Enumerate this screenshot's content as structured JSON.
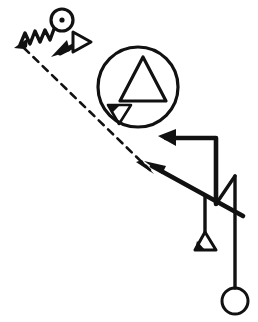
{
  "canvas": {
    "width": 258,
    "height": 322,
    "background_color": "#ffffff",
    "ink_color": "#111111",
    "title": "Abstract line-and-symbol sketch diagram"
  },
  "shapes": {
    "dot_circle": {
      "name": "circle-with-center-dot",
      "cx": 62,
      "cy": 20,
      "r": 11,
      "stroke_width": 3.2,
      "dot_r": 2.6,
      "label": "ringed dot marker"
    },
    "zigzag": {
      "name": "zigzag-spring-line",
      "points": "20,45 25,33 30,44 35,31 40,42 45,30 50,40 54,29",
      "stroke_width": 3.4,
      "label": "spring / zigzag connector"
    },
    "zigzag_arrowhead": {
      "name": "zigzag-arrowhead",
      "points": "14,48 28,38 27,47 24,49",
      "label": "filled arrowhead at zigzag tail"
    },
    "double_arrow": {
      "name": "double-headed-arrow",
      "shaft": {
        "x1": 62,
        "y1": 52,
        "x2": 78,
        "y2": 43
      },
      "stroke_width": 5,
      "solid_head": {
        "name": "solid-arrowhead-lower-left",
        "points": "52,56 70,50 66,41"
      },
      "hollow_head": {
        "name": "hollow-arrowhead-upper-right",
        "points": "72,51 72,33 90,42"
      },
      "label": "bidirectional arrow, one solid one outlined head"
    },
    "big_circle": {
      "name": "large-enclosing-circle",
      "cx": 138,
      "cy": 87,
      "r": 40,
      "stroke_width": 3.2,
      "label": "large ring containing two triangles"
    },
    "big_triangle": {
      "name": "large-up-triangle",
      "points": "143,57 166,101 120,101",
      "stroke_width": 3.2,
      "label": "hollow upward triangle inside ring"
    },
    "small_triangle": {
      "name": "small-down-triangle",
      "points": "108,105 131,105 119,124",
      "stroke_width": 2.6,
      "label": "small downward triangle inside ring"
    },
    "small_triangle_notch": {
      "name": "small-down-triangle-notch",
      "points": "108,105 120,105 112,113",
      "label": "filled corner of small triangle"
    },
    "dashed_line": {
      "name": "dashed-diagonal-line",
      "x1": 24,
      "y1": 48,
      "x2": 150,
      "y2": 170,
      "stroke_width": 2.6,
      "dash_pattern": "7 6",
      "label": "long dashed diagonal from zigzag to junction"
    },
    "dashed_arrowhead": {
      "name": "dashed-line-arrowhead",
      "points": "154,174 136,162 142,160 145,164",
      "label": "small filled arrowhead terminating dashed line"
    },
    "diagonal_thick": {
      "name": "thick-diagonal-arrow-line",
      "x1": 152,
      "y1": 166,
      "x2": 243,
      "y2": 216,
      "stroke_width": 4.6,
      "label": "thick diagonal running down-right through verticals"
    },
    "diagonal_thick_head": {
      "name": "thick-diagonal-arrowhead",
      "points": "144,161 166,166 162,174",
      "label": "filled arrowhead pointing up-left on thick diagonal"
    },
    "upper_polyline": {
      "name": "upper-bracket-polyline",
      "points": "166,138 216,138 216,204",
      "stroke_width": 4.6,
      "label": "bracket path from upper arrowhead down the right"
    },
    "upper_arrowhead": {
      "name": "upper-polyline-arrowhead",
      "points": "158,136 176,129 176,146",
      "label": "solid arrowhead at top-left of bracket path"
    },
    "hanger_polyline": {
      "name": "hanger-drop-polyline",
      "points": "205,196 205,232",
      "stroke_width": 3.4,
      "label": "short vertical dropping to small triangle"
    },
    "hanger_triangle": {
      "name": "hanger-small-triangle",
      "points": "205,232 216,250 195,250",
      "stroke_width": 3.0,
      "label": "small hollow triangle hanging at line end"
    },
    "hanger_triangle_notch": {
      "name": "hanger-triangle-filled-corner",
      "points": "195,250 205,250 197,241",
      "label": "filled lower-left corner of hanging triangle"
    },
    "pendulum_line": {
      "name": "pendulum-vertical-line",
      "x1": 235,
      "y1": 176,
      "x2": 235,
      "y2": 288,
      "stroke_width": 3.4,
      "label": "long vertical line descending to circle"
    },
    "pendulum_circle": {
      "name": "pendulum-end-circle",
      "cx": 235,
      "cy": 301,
      "r": 13,
      "stroke_width": 3.0,
      "label": "hollow circle at bottom of vertical line"
    },
    "right_connector": {
      "name": "right-angle-connector",
      "points": "216,204 235,176",
      "stroke_width": 3.4,
      "label": "short angled segment joining bracket to vertical"
    }
  }
}
